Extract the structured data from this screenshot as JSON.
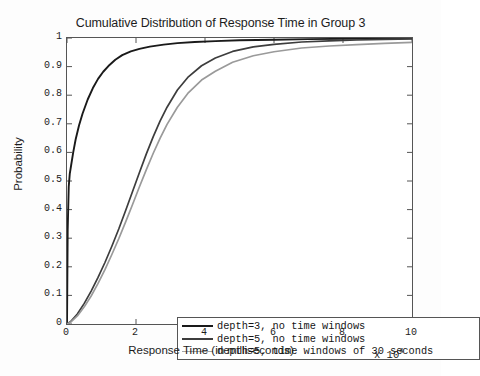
{
  "chart_data": {
    "type": "line",
    "title": "Cumulative Distribution of Response Time in Group 3",
    "xlabel": "Response Time (in milliseconds)",
    "ylabel": "Probability",
    "x_exponent_prefix": "x 10",
    "x_exponent_power": "4",
    "xlim": [
      0,
      10
    ],
    "ylim": [
      0,
      1
    ],
    "xticks": [
      "0",
      "2",
      "4",
      "6",
      "8",
      "10"
    ],
    "yticks": [
      "0",
      "0.1",
      "0.2",
      "0.3",
      "0.4",
      "0.5",
      "0.6",
      "0.7",
      "0.8",
      "0.9",
      "1"
    ],
    "grid": false,
    "legend_position": "lower right",
    "series": [
      {
        "name": "depth=3, no time windows",
        "color": "#1a1a1a",
        "width": 1.9,
        "x": [
          0,
          0.02,
          0.05,
          0.08,
          0.12,
          0.18,
          0.25,
          0.35,
          0.45,
          0.6,
          0.75,
          0.9,
          1.05,
          1.2,
          1.4,
          1.6,
          1.85,
          2.1,
          2.4,
          2.8,
          3.2,
          3.7,
          4.3,
          5.0,
          6.0,
          7.0,
          8.0,
          9.0,
          10.0
        ],
        "y": [
          0.0,
          0.33,
          0.48,
          0.525,
          0.555,
          0.6,
          0.645,
          0.695,
          0.735,
          0.785,
          0.825,
          0.857,
          0.882,
          0.902,
          0.924,
          0.94,
          0.953,
          0.962,
          0.97,
          0.977,
          0.982,
          0.986,
          0.989,
          0.992,
          0.994,
          0.996,
          0.997,
          0.998,
          0.999
        ]
      },
      {
        "name": "depth=5, no time windows",
        "color": "#3d3d3d",
        "width": 1.7,
        "x": [
          0,
          0.1,
          0.3,
          0.5,
          0.7,
          0.9,
          1.1,
          1.3,
          1.5,
          1.7,
          1.9,
          2.1,
          2.3,
          2.5,
          2.7,
          2.9,
          3.2,
          3.5,
          3.9,
          4.3,
          4.8,
          5.4,
          6.0,
          6.8,
          7.6,
          8.4,
          9.2,
          10.0
        ],
        "y": [
          0.0,
          0.008,
          0.035,
          0.072,
          0.115,
          0.163,
          0.215,
          0.272,
          0.332,
          0.397,
          0.463,
          0.53,
          0.595,
          0.655,
          0.71,
          0.758,
          0.818,
          0.862,
          0.903,
          0.93,
          0.953,
          0.969,
          0.978,
          0.986,
          0.99,
          0.993,
          0.995,
          0.997
        ]
      },
      {
        "name": "depth=5, time windows of 30 seconds",
        "color": "#9a9a9a",
        "width": 1.7,
        "x": [
          0,
          0.1,
          0.3,
          0.5,
          0.7,
          0.9,
          1.1,
          1.3,
          1.5,
          1.7,
          1.9,
          2.1,
          2.3,
          2.5,
          2.7,
          2.9,
          3.2,
          3.5,
          3.9,
          4.3,
          4.8,
          5.4,
          6.0,
          6.8,
          7.6,
          8.4,
          9.2,
          10.0
        ],
        "y": [
          0.0,
          0.006,
          0.028,
          0.06,
          0.098,
          0.142,
          0.19,
          0.243,
          0.298,
          0.357,
          0.418,
          0.48,
          0.54,
          0.597,
          0.65,
          0.698,
          0.758,
          0.806,
          0.853,
          0.884,
          0.915,
          0.938,
          0.952,
          0.965,
          0.972,
          0.977,
          0.981,
          0.985
        ]
      }
    ]
  },
  "legend": {
    "items": [
      {
        "label": "depth=3, no time windows",
        "color": "#1a1a1a",
        "width": "2.2px"
      },
      {
        "label": "depth=5, no time windows",
        "color": "#3d3d3d",
        "width": "2.0px"
      },
      {
        "label": "depth=5, time windows of 30 seconds",
        "color": "#a5a5a5",
        "width": "1.8px"
      }
    ]
  }
}
